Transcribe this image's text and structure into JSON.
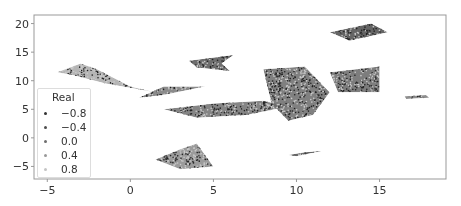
{
  "chart_data": {
    "type": "scatter",
    "title": "",
    "xlabel": "",
    "ylabel": "",
    "xlim": [
      -5.8,
      19
    ],
    "ylim": [
      -7.2,
      21.5
    ],
    "xticks": [
      -5,
      0,
      5,
      10,
      15
    ],
    "yticks": [
      -5,
      0,
      5,
      10,
      15,
      20
    ],
    "grid": false,
    "legend": {
      "title": "Real",
      "position": "lower left",
      "entries": [
        {
          "label": "−0.8",
          "color": "#333333"
        },
        {
          "label": "−0.4",
          "color": "#4d4d4d"
        },
        {
          "label": "0.0",
          "color": "#6e6e6e"
        },
        {
          "label": "0.4",
          "color": "#999999"
        },
        {
          "label": "0.8",
          "color": "#c4c4c4"
        }
      ]
    },
    "clusters": [
      {
        "name": "upper-left-wedge",
        "points": [
          [
            -4.4,
            11.5
          ],
          [
            -3,
            13
          ],
          [
            -2,
            12
          ],
          [
            0,
            9
          ],
          [
            1.5,
            8
          ],
          [
            -1.5,
            9.5
          ],
          [
            -3.5,
            11
          ]
        ],
        "shade": "#a8a8a8"
      },
      {
        "name": "left-arm",
        "points": [
          [
            0.5,
            7
          ],
          [
            2,
            9
          ],
          [
            4.5,
            9
          ],
          [
            2,
            7.5
          ]
        ],
        "shade": "#777777"
      },
      {
        "name": "center-band",
        "points": [
          [
            2,
            5
          ],
          [
            5,
            6
          ],
          [
            8,
            6.5
          ],
          [
            9.5,
            5.5
          ],
          [
            7,
            4
          ],
          [
            4,
            3.5
          ]
        ],
        "shade": "#707070"
      },
      {
        "name": "mid-top-wedge",
        "points": [
          [
            3.5,
            13.5
          ],
          [
            6.2,
            14.5
          ],
          [
            5.5,
            13
          ],
          [
            6,
            11.7
          ],
          [
            4,
            12.3
          ]
        ],
        "shade": "#555555"
      },
      {
        "name": "lower-left-blob",
        "points": [
          [
            1.5,
            -3.8
          ],
          [
            3,
            -2
          ],
          [
            4,
            -1
          ],
          [
            5,
            -5
          ],
          [
            3,
            -5.5
          ]
        ],
        "shade": "#8a8a8a"
      },
      {
        "name": "big-center",
        "points": [
          [
            8,
            12
          ],
          [
            10.5,
            12.5
          ],
          [
            12,
            8
          ],
          [
            11,
            4
          ],
          [
            9.5,
            3
          ],
          [
            8.5,
            6
          ]
        ],
        "shade": "#6a6a6a"
      },
      {
        "name": "right-rect",
        "points": [
          [
            12,
            11.5
          ],
          [
            15,
            12.5
          ],
          [
            15,
            8
          ],
          [
            12.5,
            8
          ]
        ],
        "shade": "#666666"
      },
      {
        "name": "right-ellipse",
        "points": [
          [
            16.5,
            7.3
          ],
          [
            17.8,
            7.5
          ],
          [
            18,
            7
          ],
          [
            16.6,
            6.8
          ]
        ],
        "shade": "#7a7a7a"
      },
      {
        "name": "top-right-arm",
        "points": [
          [
            12,
            18.5
          ],
          [
            14.5,
            20
          ],
          [
            15.5,
            18.5
          ],
          [
            13.2,
            17
          ]
        ],
        "shade": "#4a4a4a"
      },
      {
        "name": "bottom-spike",
        "points": [
          [
            9.5,
            -3
          ],
          [
            10.5,
            -2.5
          ],
          [
            11.5,
            -2.3
          ],
          [
            10,
            -3.2
          ]
        ],
        "shade": "#4a4a4a"
      }
    ]
  }
}
